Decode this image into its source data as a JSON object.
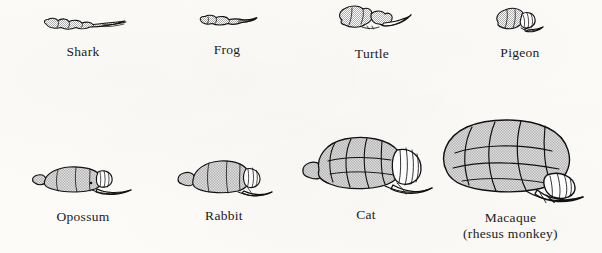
{
  "figure": {
    "background_color": "#fcfbf8",
    "ink_color": "#111111",
    "rows": 2,
    "columns": 4
  },
  "specimens": [
    {
      "id": "shark",
      "label": "Shark",
      "sublabel": "",
      "row": 1,
      "column": 1,
      "icon": "shark-brain-illustration"
    },
    {
      "id": "frog",
      "label": "Frog",
      "sublabel": "",
      "row": 1,
      "column": 2,
      "icon": "frog-brain-illustration"
    },
    {
      "id": "turtle",
      "label": "Turtle",
      "sublabel": "",
      "row": 1,
      "column": 3,
      "icon": "turtle-brain-illustration"
    },
    {
      "id": "pigeon",
      "label": "Pigeon",
      "sublabel": "",
      "row": 1,
      "column": 4,
      "icon": "pigeon-brain-illustration"
    },
    {
      "id": "opossum",
      "label": "Opossum",
      "sublabel": "",
      "row": 2,
      "column": 1,
      "icon": "opossum-brain-illustration"
    },
    {
      "id": "rabbit",
      "label": "Rabbit",
      "sublabel": "",
      "row": 2,
      "column": 2,
      "icon": "rabbit-brain-illustration"
    },
    {
      "id": "cat",
      "label": "Cat",
      "sublabel": "",
      "row": 2,
      "column": 3,
      "icon": "cat-brain-illustration"
    },
    {
      "id": "macaque",
      "label": "Macaque",
      "sublabel": "(rhesus monkey)",
      "row": 2,
      "column": 4,
      "icon": "macaque-brain-illustration"
    }
  ]
}
